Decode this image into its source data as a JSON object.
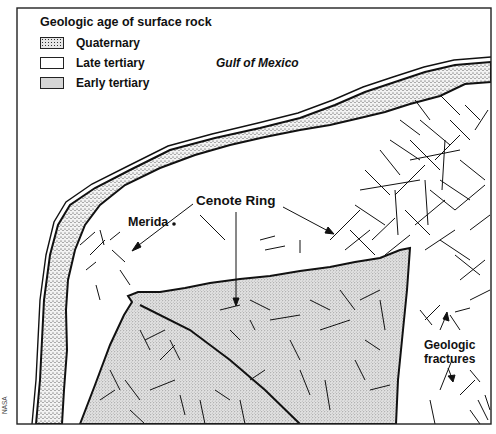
{
  "map": {
    "legend": {
      "title": "Geologic age of surface rock",
      "items": [
        {
          "label": "Quaternary",
          "pattern": "coarse-stipple"
        },
        {
          "label": "Late tertiary",
          "pattern": "blank"
        },
        {
          "label": "Early tertiary",
          "pattern": "fine-stipple"
        }
      ]
    },
    "labels": {
      "water_body": "Gulf of Mexico",
      "city": "Merida",
      "feature": "Cenote Ring",
      "fractures_line1": "Geologic",
      "fractures_line2": "fractures"
    },
    "credit": "NASA",
    "colors": {
      "ink": "#111111",
      "background": "#ffffff",
      "stipple_fill": "#d9d9d9"
    }
  }
}
